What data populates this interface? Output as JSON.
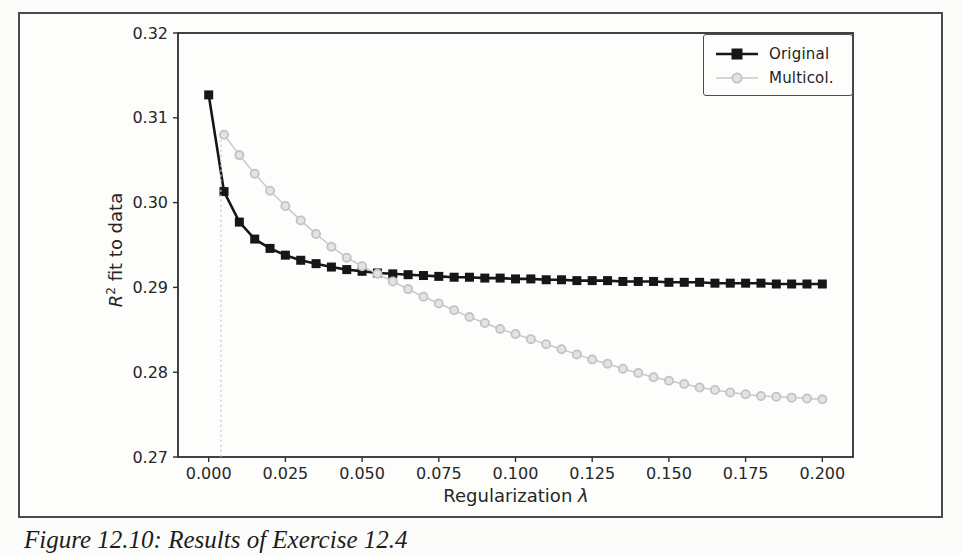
{
  "figure": {
    "caption": "Figure 12.10: Results of Exercise 12.4"
  },
  "chart_data": {
    "type": "line",
    "title": "",
    "xlabel": "Regularization λ",
    "xlabel_text": "Regularization",
    "xlabel_symbol": "λ",
    "ylabel": "R² fit to data",
    "ylabel_var": "R",
    "ylabel_sup": "2",
    "ylabel_rest": " fit to data",
    "xlim": [
      -0.01,
      0.21
    ],
    "ylim": [
      0.27,
      0.32
    ],
    "grid": false,
    "x_ticks": {
      "values": [
        0.0,
        0.025,
        0.05,
        0.075,
        0.1,
        0.125,
        0.15,
        0.175,
        0.2
      ],
      "labels": [
        "0.000",
        "0.025",
        "0.050",
        "0.075",
        "0.100",
        "0.125",
        "0.150",
        "0.175",
        "0.200"
      ]
    },
    "y_ticks": {
      "values": [
        0.27,
        0.28,
        0.29,
        0.3,
        0.31,
        0.32
      ],
      "labels": [
        "0.27",
        "0.28",
        "0.29",
        "0.30",
        "0.31",
        "0.32"
      ]
    },
    "legend": {
      "position": "upper right",
      "entries": [
        {
          "label": "Original",
          "marker": "square",
          "color": "#161616"
        },
        {
          "label": "Multicol.",
          "marker": "circle",
          "color": "#c8c8c8"
        }
      ]
    },
    "series": [
      {
        "name": "Original",
        "marker": "square",
        "line_color": "#161616",
        "marker_fill": "#161616",
        "marker_edge": "#161616",
        "line_width": 2.6,
        "x": [
          0.0,
          0.005,
          0.01,
          0.015,
          0.02,
          0.025,
          0.03,
          0.035,
          0.04,
          0.045,
          0.05,
          0.055,
          0.06,
          0.065,
          0.07,
          0.075,
          0.08,
          0.085,
          0.09,
          0.095,
          0.1,
          0.105,
          0.11,
          0.115,
          0.12,
          0.125,
          0.13,
          0.135,
          0.14,
          0.145,
          0.15,
          0.155,
          0.16,
          0.165,
          0.17,
          0.175,
          0.18,
          0.185,
          0.19,
          0.195,
          0.2
        ],
        "y": [
          0.3127,
          0.3013,
          0.2977,
          0.2957,
          0.2946,
          0.2938,
          0.2932,
          0.2928,
          0.2924,
          0.2921,
          0.2919,
          0.2917,
          0.2916,
          0.2915,
          0.2914,
          0.2913,
          0.2912,
          0.2912,
          0.2911,
          0.2911,
          0.291,
          0.291,
          0.2909,
          0.2909,
          0.2908,
          0.2908,
          0.2908,
          0.2907,
          0.2907,
          0.2907,
          0.2906,
          0.2906,
          0.2906,
          0.2905,
          0.2905,
          0.2905,
          0.2905,
          0.2904,
          0.2904,
          0.2904,
          0.2904
        ]
      },
      {
        "name": "Multicol.",
        "marker": "circle",
        "line_color": "#c8c8c8",
        "marker_fill": "#e3e3e3",
        "marker_edge": "#c3c3c3",
        "line_width": 1.5,
        "dropline": {
          "x": 0.004,
          "style": "dotted"
        },
        "x": [
          0.005,
          0.01,
          0.015,
          0.02,
          0.025,
          0.03,
          0.035,
          0.04,
          0.045,
          0.05,
          0.055,
          0.06,
          0.065,
          0.07,
          0.075,
          0.08,
          0.085,
          0.09,
          0.095,
          0.1,
          0.105,
          0.11,
          0.115,
          0.12,
          0.125,
          0.13,
          0.135,
          0.14,
          0.145,
          0.15,
          0.155,
          0.16,
          0.165,
          0.17,
          0.175,
          0.18,
          0.185,
          0.19,
          0.195,
          0.2
        ],
        "y": [
          0.308,
          0.3056,
          0.3034,
          0.3014,
          0.2996,
          0.2979,
          0.2963,
          0.2948,
          0.2935,
          0.2925,
          0.2916,
          0.2907,
          0.2898,
          0.2889,
          0.2881,
          0.2873,
          0.2865,
          0.2858,
          0.2851,
          0.2845,
          0.2839,
          0.2833,
          0.2827,
          0.2821,
          0.2815,
          0.281,
          0.2804,
          0.2799,
          0.2794,
          0.279,
          0.2786,
          0.2782,
          0.2779,
          0.2776,
          0.2774,
          0.2772,
          0.2771,
          0.277,
          0.2769,
          0.2768
        ]
      }
    ]
  },
  "colors": {
    "paper": "#fcfcfb",
    "frame_border": "#4a4a4a",
    "spine": "#2e2e2e",
    "tick_text": "#262626",
    "original_series": "#161616",
    "multicol_series": "#c8c8c8"
  }
}
